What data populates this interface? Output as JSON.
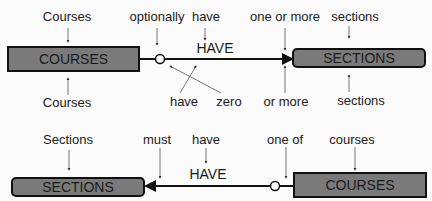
{
  "diagram1": {
    "entity_left": "COURSES",
    "entity_right": "SECTIONS",
    "relationship": "HAVE",
    "top_labels": [
      "Courses",
      "optionally",
      "have",
      "one or more",
      "sections"
    ],
    "bottom_labels": [
      "Courses",
      "have",
      "zero",
      "or more",
      "sections"
    ]
  },
  "diagram2": {
    "entity_left": "SECTIONS",
    "entity_right": "COURSES",
    "relationship": "HAVE",
    "top_labels": [
      "Sections",
      "must",
      "have",
      "one of",
      "courses"
    ]
  },
  "colors": {
    "entity_fill": "#7a7a7a",
    "line": "#111111",
    "background": "#fbfbfb"
  }
}
